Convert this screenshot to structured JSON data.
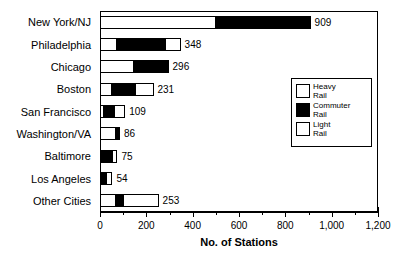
{
  "chart_data": {
    "type": "bar",
    "orientation": "horizontal",
    "stacked": true,
    "title": "",
    "xlabel": "No. of Stations",
    "ylabel": "",
    "xlim": [
      0,
      1200
    ],
    "xticks": [
      0,
      200,
      400,
      600,
      800,
      1000,
      1200
    ],
    "xtick_labels": [
      "0",
      "200",
      "400",
      "600",
      "800",
      "1,000",
      "1,200"
    ],
    "minor_tick_interval": 100,
    "grid": false,
    "legend_position": "inside-right",
    "categories": [
      "New York/NJ",
      "Philadelphia",
      "Chicago",
      "Boston",
      "San Francisco",
      "Washington/VA",
      "Baltimore",
      "Los Angeles",
      "Other Cities"
    ],
    "series": [
      {
        "name": "Heavy Rail",
        "color": "#ffffff",
        "values": [
          500,
          75,
          145,
          53,
          18,
          70,
          0,
          0,
          70
        ]
      },
      {
        "name": "Commuter Rail",
        "color": "#000000",
        "values": [
          409,
          205,
          151,
          99,
          44,
          16,
          50,
          25,
          30
        ]
      },
      {
        "name": "Light Rail",
        "color": "#ffffff",
        "values": [
          0,
          68,
          0,
          79,
          47,
          0,
          25,
          29,
          153
        ]
      }
    ],
    "totals": [
      909,
      348,
      296,
      231,
      109,
      86,
      75,
      54,
      253
    ],
    "total_labels": [
      "909",
      "348",
      "296",
      "231",
      "109",
      "86",
      "75",
      "54",
      "253"
    ]
  },
  "legend": {
    "items": [
      {
        "label": "Heavy\nRail",
        "swatch": "heavy-rail-swatch"
      },
      {
        "label": "Commuter\nRail",
        "swatch": "commuter-rail-swatch"
      },
      {
        "label": "Light\nRail",
        "swatch": "light-rail-swatch"
      }
    ]
  }
}
